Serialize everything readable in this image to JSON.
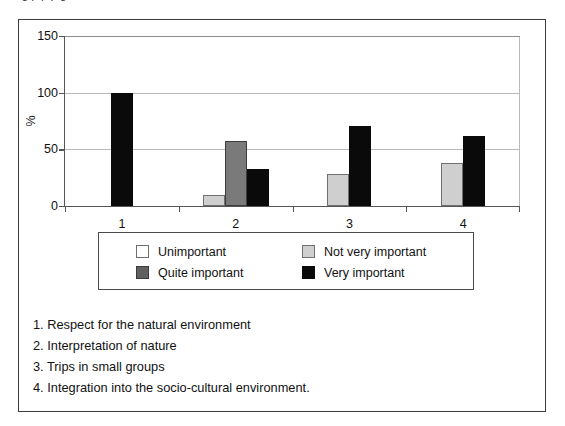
{
  "top_sliver": {
    "text": "g           p     p                    p      g"
  },
  "chart_data": {
    "type": "bar",
    "title": "",
    "subtitle": "",
    "xlabel": "",
    "ylabel": "%",
    "categories": [
      "1",
      "2",
      "3",
      "4"
    ],
    "ylim": [
      0,
      150
    ],
    "yticks": [
      0,
      50,
      100,
      150
    ],
    "ytick_labels": [
      "0",
      "50",
      "100",
      "150"
    ],
    "grid": true,
    "grid_axis": "y",
    "legend_position": "below-plot",
    "series": [
      {
        "name": "Unimportant",
        "color": "#ffffff",
        "values": [
          0,
          0,
          0,
          0
        ]
      },
      {
        "name": "Not very important",
        "color": "#cfcfcf",
        "values": [
          0,
          10,
          28,
          38
        ]
      },
      {
        "name": "Quite important",
        "color": "#606060",
        "values": [
          0,
          57,
          0,
          0
        ]
      },
      {
        "name": "Very important",
        "color": "#0a0a0a",
        "values": [
          100,
          33,
          71,
          62
        ]
      }
    ],
    "bars": [
      {
        "category": "1",
        "series": "Very important",
        "value": 100,
        "swatch": "very"
      },
      {
        "category": "2",
        "series": "Not very important",
        "value": 10,
        "swatch": "notvery"
      },
      {
        "category": "2",
        "series": "Quite important",
        "value": 57,
        "swatch": "quite"
      },
      {
        "category": "2",
        "series": "Very important",
        "value": 33,
        "swatch": "very"
      },
      {
        "category": "3",
        "series": "Not very important",
        "value": 28,
        "swatch": "notvery"
      },
      {
        "category": "3",
        "series": "Very important",
        "value": 71,
        "swatch": "very"
      },
      {
        "category": "4",
        "series": "Not very important",
        "value": 38,
        "swatch": "notvery"
      },
      {
        "category": "4",
        "series": "Very important",
        "value": 62,
        "swatch": "very"
      }
    ]
  },
  "legend": {
    "entries": [
      {
        "label": "Unimportant",
        "swatch": "unimportant"
      },
      {
        "label": "Not very important",
        "swatch": "notvery"
      },
      {
        "label": "Quite important",
        "swatch": "quite"
      },
      {
        "label": "Very important",
        "swatch": "very"
      }
    ]
  },
  "caption": {
    "lines": [
      "1. Respect for the natural environment",
      "2. Interpretation of nature",
      "3. Trips in small groups",
      "4. Integration into the socio-cultural environment."
    ]
  },
  "colors": {
    "unimportant": "#ffffff",
    "not_very_important": "#cfcfcf",
    "quite_important": "#606060",
    "very_important": "#0a0a0a",
    "gridline": "#b9b9b9",
    "axis": "#555555",
    "frame": "#3b3b3b"
  }
}
